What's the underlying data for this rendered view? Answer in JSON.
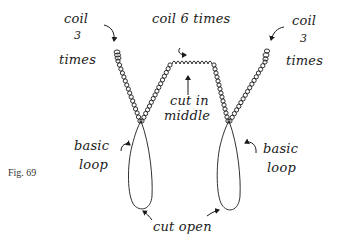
{
  "figure": {
    "caption": "Fig. 69",
    "ink_color": "#1a1a1a",
    "background": "#ffffff"
  },
  "labels": {
    "left_coil": {
      "line1": "coil",
      "line2": "3",
      "line3": "times"
    },
    "middle_coil": "coil 6 times",
    "right_coil": {
      "line1": "coil",
      "line2": "3",
      "line3": "times"
    },
    "cut_middle": {
      "line1": "cut in",
      "line2": "middle"
    },
    "left_loop": {
      "line1": "basic",
      "line2": "loop"
    },
    "right_loop": {
      "line1": "basic",
      "line2": "loop"
    },
    "cut_open": "cut open"
  }
}
